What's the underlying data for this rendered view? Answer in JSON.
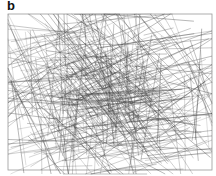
{
  "panel": {
    "label": "b",
    "frame": {
      "x": 8,
      "y": 14,
      "width": 204,
      "height": 156,
      "stroke": "#9a9a9a"
    },
    "network": {
      "description": "dense random network of overlapping straight line segments",
      "line_color": "#3a3a3a",
      "segment_count": 420,
      "seed": 7
    },
    "scale_note": ""
  }
}
